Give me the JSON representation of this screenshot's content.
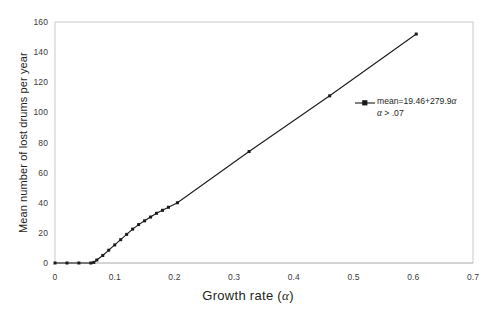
{
  "chart_data": {
    "type": "line",
    "title": "",
    "xlabel": "Growth rate (α)",
    "ylabel": "Mean number of lost drums per year",
    "xlim": [
      0,
      0.7
    ],
    "ylim": [
      0,
      160
    ],
    "xticks": [
      "0",
      "0.1",
      "0.2",
      "0.3",
      "0.4",
      "0.5",
      "0.6",
      "0.7"
    ],
    "xtick_values": [
      0,
      0.1,
      0.2,
      0.3,
      0.4,
      0.5,
      0.6,
      0.7
    ],
    "yticks": [
      "0",
      "20",
      "40",
      "60",
      "80",
      "100",
      "120",
      "140",
      "160"
    ],
    "ytick_values": [
      0,
      20,
      40,
      60,
      80,
      100,
      120,
      140,
      160
    ],
    "grid": false,
    "legend_position": "inside-right",
    "series": [
      {
        "name": "mean=19.46+279.9α",
        "marker": "square",
        "color": "#1a1a1a",
        "x": [
          0.0,
          0.02,
          0.04,
          0.06,
          0.065,
          0.07,
          0.08,
          0.09,
          0.1,
          0.11,
          0.12,
          0.13,
          0.14,
          0.15,
          0.16,
          0.17,
          0.18,
          0.19,
          0.205,
          0.325,
          0.46,
          0.605
        ],
        "y": [
          0.0,
          0.0,
          0.0,
          0.0,
          0.4,
          2.0,
          5.0,
          8.5,
          12.0,
          15.5,
          19.0,
          22.5,
          25.5,
          28.0,
          30.5,
          33.0,
          35.0,
          37.0,
          40.0,
          74.0,
          111.0,
          152.0
        ]
      }
    ],
    "annotations": [
      {
        "name": "fit-equation",
        "line1_prefix": "mean=19.46+279.9",
        "line1_symbol": "α",
        "line2_symbol": "α",
        "line2_suffix": " > .07"
      }
    ]
  },
  "axis_labels": {
    "x_title_text": "Growth  rate  (",
    "x_title_symbol": "α",
    "x_title_close": ")",
    "y_title": "Mean number of lost drums per year"
  }
}
